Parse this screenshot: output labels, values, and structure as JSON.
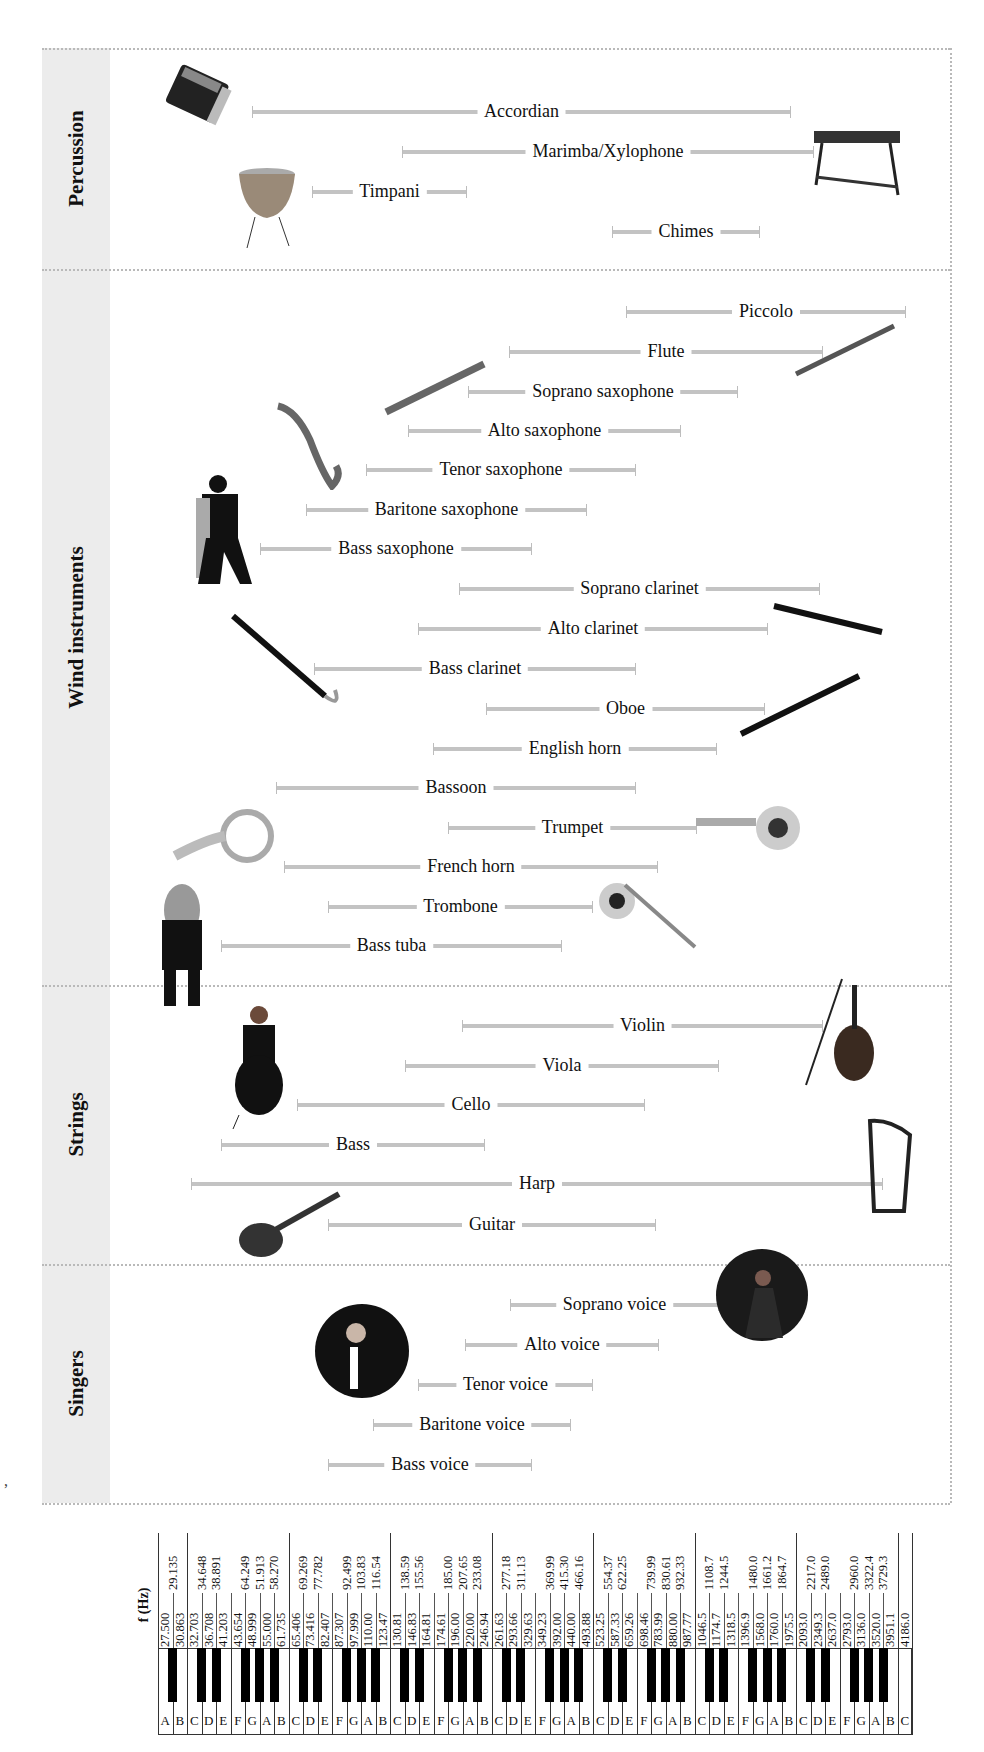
{
  "chart_data": {
    "type": "range-bar",
    "title": "",
    "xlabel": "f (Hz)",
    "scale": "piano keyboard (log frequency), A0 27.5 Hz to C8 4186 Hz",
    "groups": [
      {
        "name": "Percussion",
        "items": [
          {
            "label": "Accordian",
            "x0": 252,
            "x1": 791,
            "y": 112,
            "icon": "accordion-icon"
          },
          {
            "label": "Marimba/Xylophone",
            "x0": 402,
            "x1": 814,
            "y": 152,
            "icon": "marimba-icon"
          },
          {
            "label": "Timpani",
            "x0": 312,
            "x1": 467,
            "y": 192,
            "icon": "timpani-icon"
          },
          {
            "label": "Chimes",
            "x0": 612,
            "x1": 760,
            "y": 232,
            "icon": ""
          }
        ]
      },
      {
        "name": "Wind instruments",
        "items": [
          {
            "label": "Piccolo",
            "x0": 626,
            "x1": 906,
            "y": 312
          },
          {
            "label": "Flute",
            "x0": 509,
            "x1": 823,
            "y": 352
          },
          {
            "label": "Soprano saxophone",
            "x0": 468,
            "x1": 738,
            "y": 392
          },
          {
            "label": "Alto saxophone",
            "x0": 408,
            "x1": 681,
            "y": 431
          },
          {
            "label": "Tenor saxophone",
            "x0": 366,
            "x1": 636,
            "y": 470
          },
          {
            "label": "Baritone saxophone",
            "x0": 306,
            "x1": 587,
            "y": 510
          },
          {
            "label": "Bass saxophone",
            "x0": 260,
            "x1": 532,
            "y": 549
          },
          {
            "label": "Soprano clarinet",
            "x0": 459,
            "x1": 820,
            "y": 589
          },
          {
            "label": "Alto clarinet",
            "x0": 418,
            "x1": 768,
            "y": 629
          },
          {
            "label": "Bass clarinet",
            "x0": 314,
            "x1": 636,
            "y": 669
          },
          {
            "label": "Oboe",
            "x0": 486,
            "x1": 765,
            "y": 709
          },
          {
            "label": "English horn",
            "x0": 433,
            "x1": 717,
            "y": 749
          },
          {
            "label": "Bassoon",
            "x0": 276,
            "x1": 636,
            "y": 788
          },
          {
            "label": "Trumpet",
            "x0": 448,
            "x1": 697,
            "y": 828
          },
          {
            "label": "French horn",
            "x0": 284,
            "x1": 658,
            "y": 867
          },
          {
            "label": "Trombone",
            "x0": 328,
            "x1": 593,
            "y": 907
          },
          {
            "label": "Bass tuba",
            "x0": 221,
            "x1": 562,
            "y": 946
          }
        ]
      },
      {
        "name": "Strings",
        "items": [
          {
            "label": "Violin",
            "x0": 462,
            "x1": 823,
            "y": 1026
          },
          {
            "label": "Viola",
            "x0": 405,
            "x1": 719,
            "y": 1066
          },
          {
            "label": "Cello",
            "x0": 297,
            "x1": 645,
            "y": 1105
          },
          {
            "label": "Bass",
            "x0": 221,
            "x1": 485,
            "y": 1145
          },
          {
            "label": "Harp",
            "x0": 191,
            "x1": 883,
            "y": 1184
          },
          {
            "label": "Guitar",
            "x0": 328,
            "x1": 656,
            "y": 1225
          }
        ]
      },
      {
        "name": "Singers",
        "items": [
          {
            "label": "Soprano voice",
            "x0": 510,
            "x1": 719,
            "y": 1305
          },
          {
            "label": "Alto voice",
            "x0": 465,
            "x1": 659,
            "y": 1345
          },
          {
            "label": "Tenor voice",
            "x0": 418,
            "x1": 593,
            "y": 1385
          },
          {
            "label": "Baritone voice",
            "x0": 373,
            "x1": 571,
            "y": 1425
          },
          {
            "label": "Bass voice",
            "x0": 328,
            "x1": 532,
            "y": 1465
          }
        ]
      }
    ],
    "bands": [
      {
        "name": "Percussion",
        "top": 48,
        "bottom": 269
      },
      {
        "name": "Wind instruments",
        "top": 269,
        "bottom": 985
      },
      {
        "name": "Strings",
        "top": 985,
        "bottom": 1264
      },
      {
        "name": "Singers",
        "top": 1264,
        "bottom": 1503
      }
    ],
    "keyboard": {
      "white_keys": [
        "A",
        "B",
        "C",
        "D",
        "E",
        "F",
        "G",
        "A",
        "B",
        "C",
        "D",
        "E",
        "F",
        "G",
        "A",
        "B",
        "C",
        "D",
        "E",
        "F",
        "G",
        "A",
        "B",
        "C",
        "D",
        "E",
        "F",
        "G",
        "A",
        "B",
        "C",
        "D",
        "E",
        "F",
        "G",
        "A",
        "B",
        "C",
        "D",
        "E",
        "F",
        "G",
        "A",
        "B",
        "C",
        "D",
        "E",
        "F",
        "G",
        "A",
        "B",
        "C"
      ],
      "white_freqs": [
        "27.500",
        "30.863",
        "32.703",
        "36.708",
        "41.203",
        "43.654",
        "48.999",
        "55.000",
        "61.735",
        "65.406",
        "73.416",
        "82.407",
        "87.307",
        "97.999",
        "110.00",
        "123.47",
        "130.81",
        "146.83",
        "164.81",
        "174.61",
        "196.00",
        "220.00",
        "246.94",
        "261.63",
        "293.66",
        "329.63",
        "349.23",
        "392.00",
        "440.00",
        "493.88",
        "523.25",
        "587.33",
        "659.26",
        "698.46",
        "783.99",
        "880.00",
        "987.77",
        "1046.5",
        "1174.7",
        "1318.5",
        "1396.9",
        "1568.0",
        "1760.0",
        "1975.5",
        "2093.0",
        "2349.3",
        "2637.0",
        "2793.0",
        "3136.0",
        "3520.0",
        "3951.1",
        "4186.0"
      ],
      "black_keys": [
        {
          "after": 0,
          "freq": "29.135"
        },
        {
          "after": 2,
          "freq": "34.648"
        },
        {
          "after": 3,
          "freq": "38.891"
        },
        {
          "after": 5,
          "freq": "64.249"
        },
        {
          "after": 6,
          "freq": "51.913"
        },
        {
          "after": 7,
          "freq": "58.270"
        },
        {
          "after": 9,
          "freq": "69.269"
        },
        {
          "after": 10,
          "freq": "77.782"
        },
        {
          "after": 12,
          "freq": "92.499"
        },
        {
          "after": 13,
          "freq": "103.83"
        },
        {
          "after": 14,
          "freq": "116.54"
        },
        {
          "after": 16,
          "freq": "138.59"
        },
        {
          "after": 17,
          "freq": "155.56"
        },
        {
          "after": 19,
          "freq": "185.00"
        },
        {
          "after": 20,
          "freq": "207.65"
        },
        {
          "after": 21,
          "freq": "233.08"
        },
        {
          "after": 23,
          "freq": "277.18"
        },
        {
          "after": 24,
          "freq": "311.13"
        },
        {
          "after": 26,
          "freq": "369.99"
        },
        {
          "after": 27,
          "freq": "415.30"
        },
        {
          "after": 28,
          "freq": "466.16"
        },
        {
          "after": 30,
          "freq": "554.37"
        },
        {
          "after": 31,
          "freq": "622.25"
        },
        {
          "after": 33,
          "freq": "739.99"
        },
        {
          "after": 34,
          "freq": "830.61"
        },
        {
          "after": 35,
          "freq": "932.33"
        },
        {
          "after": 37,
          "freq": "1108.7"
        },
        {
          "after": 38,
          "freq": "1244.5"
        },
        {
          "after": 40,
          "freq": "1480.0"
        },
        {
          "after": 41,
          "freq": "1661.2"
        },
        {
          "after": 42,
          "freq": "1864.7"
        },
        {
          "after": 44,
          "freq": "2217.0"
        },
        {
          "after": 45,
          "freq": "2489.0"
        },
        {
          "after": 47,
          "freq": "2960.0"
        },
        {
          "after": 48,
          "freq": "3322.4"
        },
        {
          "after": 49,
          "freq": "3729.3"
        }
      ]
    },
    "grid": false,
    "legend": "none"
  },
  "axis": {
    "label": "f (Hz)"
  },
  "stray_text": ",",
  "colors": {
    "bar": "#c3c3c3",
    "band": "#ececec",
    "separator": "#b9b9b9"
  }
}
